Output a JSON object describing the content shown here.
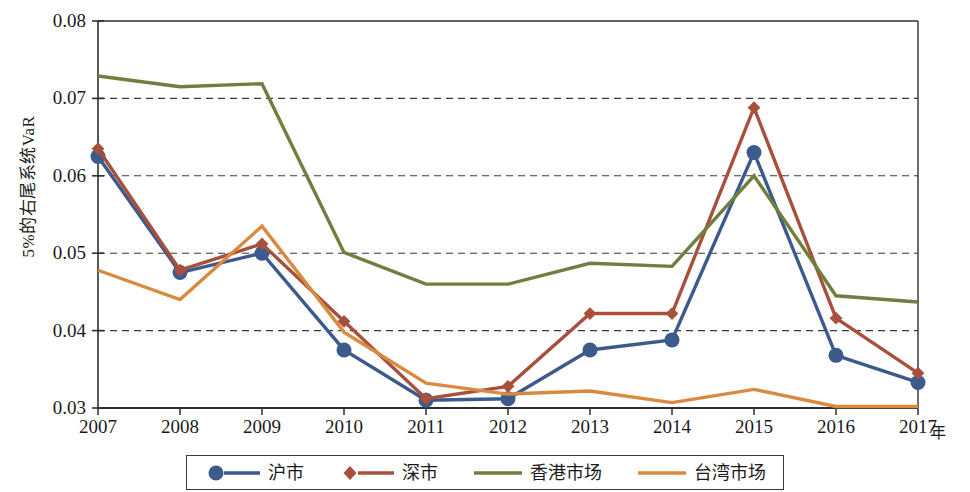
{
  "chart_data": {
    "type": "line",
    "title": "",
    "xlabel": "年",
    "ylabel": "5%的右尾系统VaR",
    "categories": [
      "2007",
      "2008",
      "2009",
      "2010",
      "2011",
      "2012",
      "2013",
      "2014",
      "2015",
      "2016",
      "2017"
    ],
    "x": [
      2007,
      2008,
      2009,
      2010,
      2011,
      2012,
      2013,
      2014,
      2015,
      2016,
      2017
    ],
    "ylim": [
      0.03,
      0.08
    ],
    "xlim": [
      2007,
      2017
    ],
    "yticks": [
      "0.03",
      "0.04",
      "0.05",
      "0.06",
      "0.07",
      "0.08"
    ],
    "ytick_values": [
      0.03,
      0.04,
      0.05,
      0.06,
      0.07,
      0.08
    ],
    "grid": "horizontal-dashed",
    "legend_position": "bottom",
    "series": [
      {
        "name": "沪市",
        "color": "#3c5a8c",
        "marker": "circle",
        "values": [
          0.0625,
          0.0475,
          0.05,
          0.0375,
          0.031,
          0.0312,
          0.0375,
          0.0388,
          0.063,
          0.0368,
          0.0333
        ]
      },
      {
        "name": "深市",
        "color": "#a8503c",
        "marker": "diamond",
        "values": [
          0.0635,
          0.0478,
          0.0512,
          0.0412,
          0.0312,
          0.0328,
          0.0422,
          0.0422,
          0.0688,
          0.0416,
          0.0345
        ]
      },
      {
        "name": "香港市场",
        "color": "#6e7f3e",
        "marker": "none",
        "values": [
          0.0729,
          0.0715,
          0.0719,
          0.0501,
          0.046,
          0.046,
          0.0487,
          0.0483,
          0.06,
          0.0445,
          0.0437
        ]
      },
      {
        "name": "台湾市场",
        "color": "#d98a3f",
        "marker": "none",
        "values": [
          0.0478,
          0.044,
          0.0535,
          0.0398,
          0.0332,
          0.0318,
          0.0322,
          0.0307,
          0.0324,
          0.0302,
          0.0302
        ]
      }
    ]
  },
  "axis": {
    "y_title": "5%的右尾系统VaR",
    "x_unit": "年"
  },
  "legend": {
    "items": [
      {
        "label": "沪市",
        "color": "#3c5a8c",
        "marker": "circle"
      },
      {
        "label": "深市",
        "color": "#a8503c",
        "marker": "diamond"
      },
      {
        "label": "香港市场",
        "color": "#6e7f3e",
        "marker": "none"
      },
      {
        "label": "台湾市场",
        "color": "#d98a3f",
        "marker": "none"
      }
    ]
  }
}
